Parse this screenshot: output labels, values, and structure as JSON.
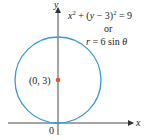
{
  "figure": {
    "equation_cartesian": {
      "x": "x",
      "x_exp": "2",
      "middle": " + (",
      "y": "y",
      "minus3": " − 3)",
      "exp2": "2",
      "rhs": " = 9"
    },
    "connector": "or",
    "equation_polar": {
      "r": "r",
      "rest": " = 6 sin ",
      "theta": "θ"
    },
    "axes": {
      "x_label": "x",
      "y_label": "y",
      "origin_label": "0"
    },
    "center_point": {
      "label": "(0, 3)",
      "color": "#e0572b"
    },
    "circle": {
      "color": "#3a9ad1",
      "center": [
        0,
        3
      ],
      "radius": 3
    },
    "axis_color": "#333333"
  }
}
